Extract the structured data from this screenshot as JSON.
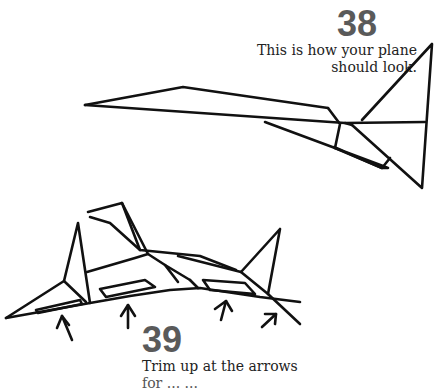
{
  "steps": [
    {
      "number": "38",
      "caption_line1": "This is how your plane",
      "caption_line2": "should look."
    },
    {
      "number": "39",
      "caption_line1": "Trim up at the arrows",
      "caption_line2": "for ... ..."
    }
  ],
  "illustrations": [
    {
      "name": "plane-side-view",
      "description": "Finished paper plane, side view"
    },
    {
      "name": "plane-rear-view",
      "description": "Plane viewed from rear with trim arrows",
      "arrow_count": 4
    }
  ],
  "colors": {
    "number": "#5a5a5a",
    "ink": "#111111",
    "background": "#ffffff"
  }
}
